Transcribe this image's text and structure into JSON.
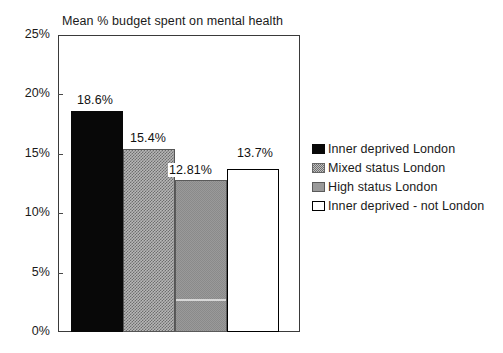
{
  "chart_data": {
    "type": "bar",
    "title": "Mean % budget spent on mental health",
    "xlabel": "",
    "ylabel": "",
    "ylim": [
      0,
      25
    ],
    "ytick_labels": [
      "25%",
      "20%",
      "15%",
      "10%",
      "5%",
      "0%"
    ],
    "ytick_values": [
      25,
      20,
      15,
      10,
      5,
      0
    ],
    "grid": false,
    "legend_position": "right",
    "categories": [
      "Inner deprived London",
      "Mixed status London",
      "High status London",
      "Inner deprived - not London"
    ],
    "values": [
      18.6,
      15.4,
      12.81,
      13.7
    ],
    "data_labels": [
      "18.6%",
      "15.4%",
      "12.81%",
      "13.7%"
    ],
    "series": [
      {
        "name": "Mean % budget spent on mental health",
        "values": [
          18.6,
          15.4,
          12.81,
          13.7
        ]
      }
    ],
    "bar_styles": [
      "solid-black",
      "checker-dotted",
      "gray",
      "white-outline"
    ],
    "colors": {
      "bar_1": "#080808",
      "bar_2": "#b7b7b7",
      "bar_3": "#9a9a9a",
      "bar_4": "#ffffff",
      "axis": "#3a3a3a",
      "text": "#1a1a1a"
    }
  },
  "legend": {
    "items": [
      {
        "label": "Inner deprived London",
        "swatch": "solid-black-swatch"
      },
      {
        "label": "Mixed status London",
        "swatch": "checker-dotted-swatch"
      },
      {
        "label": "High status London",
        "swatch": "gray-swatch"
      },
      {
        "label": "Inner deprived - not London",
        "swatch": "white-outline-swatch"
      }
    ]
  }
}
